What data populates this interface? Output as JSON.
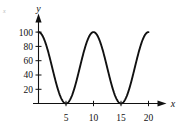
{
  "figure": {
    "name": "cosine-wave-graph",
    "background_color": "#ffffff",
    "ink_color": "#111111",
    "corner_mark": "x"
  },
  "axes": {
    "y_axis_name": "y",
    "x_axis_name": "x"
  },
  "chart_data": {
    "type": "line",
    "title": "",
    "subtitle": "",
    "xlabel": "x",
    "ylabel": "y",
    "xlim": [
      0,
      21.5
    ],
    "ylim": [
      0,
      112
    ],
    "grid": false,
    "legend": null,
    "x_ticks": [
      5,
      10,
      15,
      20
    ],
    "x_tick_labels": [
      "5",
      "10",
      "15",
      "20"
    ],
    "y_ticks": [
      20,
      40,
      60,
      80,
      100
    ],
    "y_tick_labels": [
      "20",
      "40",
      "60",
      "80",
      "100"
    ],
    "annotations": [],
    "series": [
      {
        "name": "y = 50(1 + cos(2*pi*x/10))",
        "amplitude": 50,
        "midline": 50,
        "period": 10,
        "maximum": 100,
        "minimum": 0,
        "maxima_at_x": [
          0,
          10,
          20
        ],
        "minima_at_x": [
          5,
          15
        ],
        "x": [
          0,
          0.5,
          1,
          1.5,
          2,
          2.5,
          3,
          3.5,
          4,
          4.5,
          5,
          5.5,
          6,
          6.5,
          7,
          7.5,
          8,
          8.5,
          9,
          9.5,
          10,
          10.5,
          11,
          11.5,
          12,
          12.5,
          13,
          13.5,
          14,
          14.5,
          15,
          15.5,
          16,
          16.5,
          17,
          17.5,
          18,
          18.5,
          19,
          19.5,
          20
        ],
        "values": [
          100,
          97.6,
          90.5,
          79.4,
          65.5,
          50,
          34.5,
          20.6,
          9.5,
          2.4,
          0,
          2.4,
          9.5,
          20.6,
          34.5,
          50,
          65.5,
          79.4,
          90.5,
          97.6,
          100,
          97.6,
          90.5,
          79.4,
          65.5,
          50,
          34.5,
          20.6,
          9.5,
          2.4,
          0,
          2.4,
          9.5,
          20.6,
          34.5,
          50,
          65.5,
          79.4,
          90.5,
          97.6,
          100
        ]
      }
    ]
  }
}
